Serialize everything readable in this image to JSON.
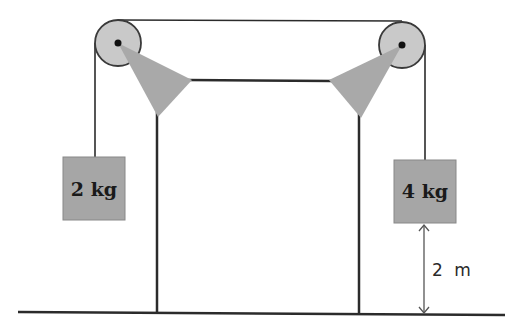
{
  "diagram": {
    "type": "pulley-system (Atwood machine on frame)",
    "colors": {
      "line": "#2b2b2b",
      "pulley_fill": "#c8c8c8",
      "support_fill": "#a9a9a9",
      "block_fill": "#a6a6a6",
      "background": "#ffffff"
    },
    "pulleys": [
      {
        "id": "left",
        "cx": 118,
        "cy": 43,
        "r": 23
      },
      {
        "id": "right",
        "cx": 402,
        "cy": 45,
        "r": 23
      }
    ],
    "blocks": [
      {
        "id": "left",
        "label": "2 kg",
        "mass_kg": 2
      },
      {
        "id": "right",
        "label": "4 kg",
        "mass_kg": 4
      }
    ],
    "dimension": {
      "label": "2 m",
      "description": "height of 4 kg block above floor"
    }
  }
}
